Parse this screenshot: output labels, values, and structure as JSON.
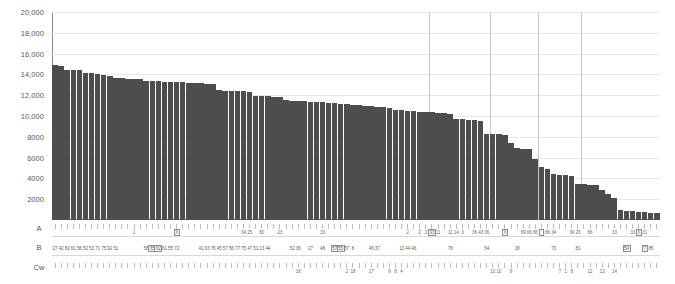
{
  "chart_data": {
    "type": "bar",
    "title": "",
    "subtitle": "",
    "xlabel": "",
    "ylabel": "",
    "ylim": [
      0,
      20000
    ],
    "grid": "horizontal-and-vertical",
    "legend": "none",
    "y_ticks": [
      "20,000",
      "18,000",
      "16,000",
      "14,000",
      "12,000",
      "10,000",
      "8000",
      "6000",
      "4000",
      "2000"
    ],
    "y_tick_values": [
      20000,
      18000,
      16000,
      14000,
      12000,
      10000,
      8000,
      6000,
      4000,
      2000
    ],
    "vertical_gridline_indices": [
      62,
      72,
      80,
      87
    ],
    "bar_color": "#4d4d4f",
    "n_bars": 100,
    "values": [
      14950,
      14780,
      14450,
      14420,
      14400,
      14150,
      14100,
      14050,
      13900,
      13850,
      13700,
      13650,
      13600,
      13580,
      13550,
      13400,
      13350,
      13320,
      13300,
      13280,
      13250,
      13230,
      13200,
      13180,
      13150,
      13120,
      13100,
      12500,
      12450,
      12430,
      12400,
      12380,
      12350,
      11950,
      11900,
      11880,
      11850,
      11820,
      11500,
      11450,
      11420,
      11400,
      11380,
      11350,
      11300,
      11280,
      11250,
      11200,
      11150,
      11100,
      11050,
      11000,
      10950,
      10900,
      10850,
      10800,
      10600,
      10550,
      10500,
      10450,
      10400,
      10380,
      10350,
      10300,
      10250,
      10200,
      9750,
      9700,
      9650,
      9600,
      9550,
      8300,
      8280,
      8250,
      8200,
      7400,
      6900,
      6850,
      6800,
      5900,
      5100,
      4900,
      4400,
      4350,
      4300,
      4280,
      3500,
      3450,
      3400,
      3350,
      2900,
      2500,
      2100,
      1000,
      900,
      850,
      800,
      750,
      700,
      650
    ]
  },
  "rows": {
    "A": {
      "label": "A",
      "values": [
        "",
        "",
        "",
        "",
        "",
        "",
        "",
        "",
        "",
        "",
        "",
        "",
        "",
        "1",
        "",
        "",
        "",
        "",
        "",
        "",
        "X",
        "",
        "",
        "",
        "",
        "",
        "",
        "",
        "",
        "",
        "",
        "34",
        "25",
        "",
        "80",
        "",
        "",
        "23",
        "",
        "",
        "",
        "",
        "",
        "",
        "33",
        "",
        "",
        "",
        "",
        "",
        "",
        "",
        "",
        "",
        "",
        "",
        "",
        "",
        "2",
        "",
        "2",
        "2",
        "93",
        "11",
        "",
        "11",
        "14",
        "3",
        "",
        "36",
        "43",
        "36",
        "",
        "",
        "X",
        "",
        "",
        "69",
        "66",
        "66",
        "",
        "86",
        "34",
        "",
        "",
        "34",
        "26",
        "",
        "66",
        "",
        "",
        "",
        "33",
        "",
        "",
        "33",
        "X",
        "31",
        "",
        ""
      ],
      "boxed_indices": [
        20,
        62,
        74,
        80,
        96
      ]
    },
    "B": {
      "label": "B",
      "values": [
        "27",
        "42",
        "82",
        "61",
        "56",
        "52",
        "53",
        "71",
        "75",
        "92",
        "51",
        "",
        "",
        "",
        "",
        "58",
        "35",
        "62",
        "61",
        "55",
        "72",
        "",
        "",
        "",
        "41",
        "63",
        "76",
        "45",
        "57",
        "56",
        "77",
        "75",
        "47",
        "51",
        "13",
        "44",
        "",
        "",
        "",
        "52",
        "36",
        "",
        "27",
        "",
        "48",
        "",
        "57",
        "55",
        "57",
        "8",
        "",
        "",
        "46",
        "37",
        "",
        "",
        "",
        "13",
        "44",
        "46",
        "",
        "",
        "",
        "",
        "",
        "78",
        "",
        "",
        "",
        "",
        "",
        "54",
        "",
        "",
        "",
        "",
        "18",
        "",
        "",
        "",
        "",
        "",
        "73",
        "",
        "",
        "",
        "81",
        "",
        "",
        "",
        "",
        "",
        "",
        "",
        "54",
        "",
        "",
        "7",
        "85",
        ""
      ],
      "boxed_indices": [
        16,
        17,
        46,
        47,
        94,
        97
      ]
    },
    "Cw": {
      "label": "Cw",
      "values": [
        "",
        "",
        "",
        "",
        "",
        "",
        "",
        "",
        "",
        "",
        "",
        "",
        "",
        "",
        "",
        "",
        "",
        "",
        "",
        "",
        "",
        "",
        "",
        "",
        "",
        "",
        "",
        "",
        "",
        "",
        "",
        "",
        "",
        "",
        "",
        "",
        "",
        "",
        "",
        "",
        "16",
        "",
        "",
        "",
        "",
        "",
        "",
        "",
        "2",
        "18",
        "",
        "",
        "17",
        "",
        "",
        "9",
        "8",
        "4",
        "",
        "",
        "",
        "",
        "",
        "",
        "",
        "",
        "",
        "",
        "",
        "",
        "",
        "",
        "10",
        "10",
        "",
        "9",
        "",
        "",
        "",
        "",
        "",
        "",
        "",
        "7",
        "1",
        "8",
        "",
        "",
        "12",
        "",
        "13",
        "",
        "14",
        "",
        "",
        "",
        "",
        "",
        "",
        ""
      ],
      "boxed_indices": []
    }
  }
}
